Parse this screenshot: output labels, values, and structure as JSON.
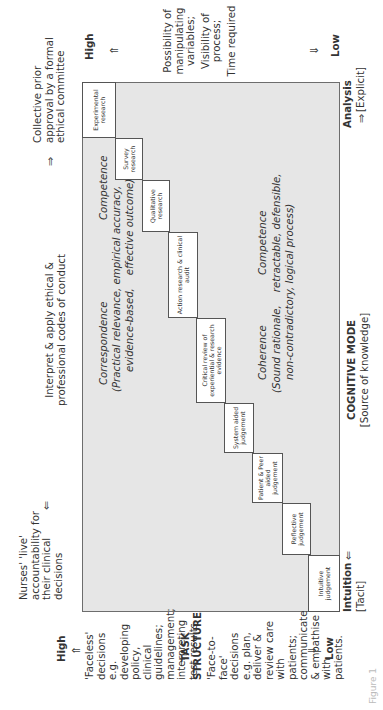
{
  "figure": {
    "caption": "Figure 1"
  },
  "top_axis": {
    "left_text": "Nurses' 'live' accountability for their clinical decisions",
    "left_arrow": "⇐",
    "middle_text": "Interpret & apply ethical & professional codes of conduct",
    "right_arrow": "⇒",
    "right_text": "Collective prior approval by a formal ethical committee"
  },
  "right_axis": {
    "high_label": "High",
    "up_arrow": "⇑",
    "description": [
      "Possibility of manipulating variables;",
      "Visibility of process;",
      "Time required"
    ],
    "down_arrow": "⇓",
    "low_label": "Low"
  },
  "left_axis": {
    "high_label": "High",
    "up_arrow": "⇑",
    "high_description": "'Faceless' decisions e.g. developing policy, clinical guidelines; management; interpreting test results.",
    "title_line1": "TASK",
    "title_line2": "STRUCTURE",
    "low_description": "'Face-to-face' decisions e.g. plan, deliver & review care with patients; communicate & empathise with patients.",
    "down_arrow": "⇓",
    "low_label": "Low"
  },
  "bottom_axis": {
    "intuition_label": "Intuition",
    "intuition_sub": "[Tacit]",
    "intuition_arrow": "⇐",
    "title": "COGNITIVE MODE",
    "subtitle": "[Source of knowledge]",
    "analysis_arrow": "⇒",
    "analysis_label": "Analysis",
    "analysis_sub": "[Explicit]"
  },
  "inner_text": {
    "correspondence_title": "Correspondence",
    "correspondence_comp": "Competence",
    "correspondence_line1": "(Practical relevance, empirical accuracy,",
    "correspondence_line2": "evidence-based,    effective outcome)",
    "coherence_title": "Coherence",
    "coherence_comp": "Competence",
    "coherence_line1": "(Sound rationale,    retractable, defensible,",
    "coherence_line2": "non-contradictory, logical process)"
  },
  "steps": [
    {
      "label": "Intuitive judgement"
    },
    {
      "label": "Reflective judgement"
    },
    {
      "label": "Patient & Peer aided judgement"
    },
    {
      "label": "System aided judgement"
    },
    {
      "label": "Critical review of experiential & research evidence"
    },
    {
      "label": "Action research & clinical audit"
    },
    {
      "label": "Qualitative research"
    },
    {
      "label": "Survey research"
    },
    {
      "label": "Experimental research"
    }
  ]
}
